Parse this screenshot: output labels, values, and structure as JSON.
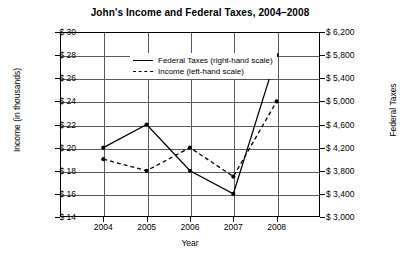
{
  "chart_data": {
    "type": "line",
    "title": "John's Income and Federal Taxes, 2004–2008",
    "xlabel": "Year",
    "ylabel": "Income (in thousands)",
    "y2label": "Federal Taxes",
    "categories": [
      "2004",
      "2005",
      "2006",
      "2007",
      "2008"
    ],
    "grid": true,
    "legend_position": "upper-center",
    "axes": {
      "left": {
        "label": "Income (in thousands)",
        "ticks": [
          "$ 14",
          "$ 16",
          "$ 18",
          "$ 20",
          "$ 22",
          "$ 24",
          "$ 26",
          "$ 28",
          "$ 30"
        ],
        "tick_values": [
          14,
          16,
          18,
          20,
          22,
          24,
          26,
          28,
          30
        ],
        "ylim": [
          14,
          30
        ],
        "step": 2
      },
      "right": {
        "label": "Federal Taxes",
        "ticks": [
          "$ 3,000",
          "$ 3,400",
          "$ 3,800",
          "$ 4,200",
          "$ 4,600",
          "$ 5,000",
          "$ 5,400",
          "$ 5,800",
          "$ 6,200"
        ],
        "tick_values": [
          3000,
          3400,
          3800,
          4200,
          4600,
          5000,
          5400,
          5800,
          6200
        ],
        "ylim": [
          3000,
          6200
        ],
        "step": 400
      }
    },
    "series": [
      {
        "name": "Federal Taxes (right-hand scale)",
        "legend_label": "Federal Taxes (right-hand scale)",
        "axis": "right",
        "style": "solid",
        "color": "#000000",
        "values": [
          4200,
          4600,
          3800,
          3400,
          5800
        ]
      },
      {
        "name": "Income (left-hand scale)",
        "legend_label": "Income (left-hand scale)",
        "axis": "left",
        "style": "dashed",
        "color": "#000000",
        "values": [
          19,
          18,
          20,
          17.5,
          24
        ]
      }
    ]
  }
}
